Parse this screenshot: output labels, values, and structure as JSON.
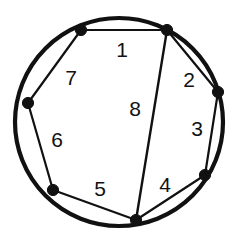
{
  "figure": {
    "type": "geometric-diagram",
    "background_color": "#ffffff",
    "stroke_color": "#111111",
    "circle": {
      "center_x": 119,
      "center_y": 122,
      "radius": 104,
      "stroke_width": 4.2
    },
    "vertices": [
      {
        "id": "v1",
        "label": "top-left",
        "x": 81,
        "y": 30
      },
      {
        "id": "v2",
        "label": "top-right",
        "x": 167,
        "y": 30
      },
      {
        "id": "v3",
        "label": "right",
        "x": 218,
        "y": 92
      },
      {
        "id": "v4",
        "label": "lower-right",
        "x": 205,
        "y": 175
      },
      {
        "id": "v5",
        "label": "bottom",
        "x": 136,
        "y": 220
      },
      {
        "id": "v6",
        "label": "lower-left",
        "x": 53,
        "y": 190
      },
      {
        "id": "v7",
        "label": "left",
        "x": 28,
        "y": 103
      }
    ],
    "chords": [
      {
        "id": "c1",
        "from": "v1",
        "to": "v2",
        "region": "1"
      },
      {
        "id": "c2",
        "from": "v2",
        "to": "v3",
        "region": "2"
      },
      {
        "id": "c3",
        "from": "v3",
        "to": "v4",
        "region": "3"
      },
      {
        "id": "c4",
        "from": "v4",
        "to": "v5",
        "region": "4"
      },
      {
        "id": "c5",
        "from": "v5",
        "to": "v6",
        "region": "5"
      },
      {
        "id": "c6",
        "from": "v6",
        "to": "v7",
        "region": "6"
      },
      {
        "id": "c7",
        "from": "v7",
        "to": "v1",
        "region": "7"
      },
      {
        "id": "c8",
        "from": "v2",
        "to": "v5",
        "region": "8",
        "long": true
      }
    ],
    "region_labels": [
      {
        "id": "r1",
        "text": "1",
        "x": 122,
        "y": 51
      },
      {
        "id": "r2",
        "text": "2",
        "x": 189,
        "y": 81
      },
      {
        "id": "r3",
        "text": "3",
        "x": 197,
        "y": 130
      },
      {
        "id": "r4",
        "text": "4",
        "x": 165,
        "y": 186
      },
      {
        "id": "r5",
        "text": "5",
        "x": 100,
        "y": 190
      },
      {
        "id": "r6",
        "text": "6",
        "x": 57,
        "y": 141
      },
      {
        "id": "r7",
        "text": "7",
        "x": 71,
        "y": 79
      },
      {
        "id": "r8",
        "text": "8",
        "x": 135,
        "y": 110
      }
    ]
  }
}
